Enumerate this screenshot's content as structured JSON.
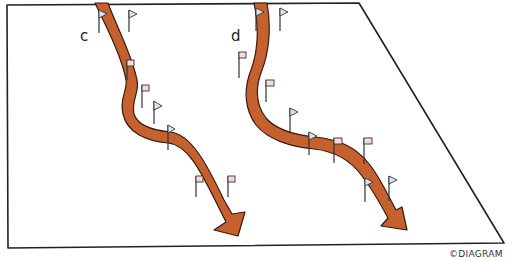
{
  "diagram": {
    "colors": {
      "arrow_fill": "#c4612f",
      "arrow_stroke": "#3a1a0c",
      "frame": "#222222",
      "flag_blue": "#dfe4ef",
      "flag_pink": "#f4dcd8",
      "pole": "#333333"
    },
    "courses": [
      {
        "id": "c",
        "label": "c",
        "flags": [
          {
            "x": 99,
            "y": 12,
            "shape": "triangle",
            "color": "blue"
          },
          {
            "x": 129,
            "y": 12,
            "shape": "triangle",
            "color": "blue"
          },
          {
            "x": 127,
            "y": 60,
            "shape": "square",
            "color": "pink"
          },
          {
            "x": 142,
            "y": 85,
            "shape": "square",
            "color": "pink"
          },
          {
            "x": 154,
            "y": 103,
            "shape": "triangle",
            "color": "blue"
          },
          {
            "x": 168,
            "y": 126,
            "shape": "triangle",
            "color": "blue"
          },
          {
            "x": 196,
            "y": 176,
            "shape": "square",
            "color": "pink"
          },
          {
            "x": 228,
            "y": 176,
            "shape": "square",
            "color": "pink"
          }
        ]
      },
      {
        "id": "d",
        "label": "d",
        "flags": [
          {
            "x": 256,
            "y": 8,
            "shape": "triangle",
            "color": "blue"
          },
          {
            "x": 280,
            "y": 8,
            "shape": "triangle",
            "color": "blue"
          },
          {
            "x": 239,
            "y": 52,
            "shape": "square",
            "color": "pink"
          },
          {
            "x": 266,
            "y": 80,
            "shape": "square",
            "color": "pink"
          },
          {
            "x": 290,
            "y": 108,
            "shape": "triangle",
            "color": "blue"
          },
          {
            "x": 309,
            "y": 132,
            "shape": "triangle",
            "color": "blue"
          },
          {
            "x": 334,
            "y": 138,
            "shape": "square",
            "color": "pink"
          },
          {
            "x": 364,
            "y": 138,
            "shape": "square",
            "color": "pink"
          },
          {
            "x": 365,
            "y": 178,
            "shape": "triangle",
            "color": "blue"
          },
          {
            "x": 389,
            "y": 176,
            "shape": "triangle",
            "color": "blue"
          }
        ]
      }
    ],
    "copyright": "©DIAGRAM"
  }
}
